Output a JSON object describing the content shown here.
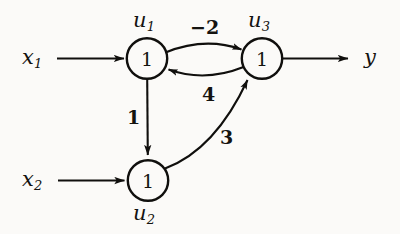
{
  "figure": {
    "kind": "signal-flow-graph",
    "background_color": "#fbfaf8",
    "ink_color": "#100f0d"
  },
  "inputs": [
    {
      "id": "x1",
      "label": "x",
      "subscript": "1",
      "arrow_name": "input-arrow-x1",
      "target": "u1"
    },
    {
      "id": "x2",
      "label": "x",
      "subscript": "2",
      "arrow_name": "input-arrow-x2",
      "target": "u2"
    }
  ],
  "output": {
    "id": "y",
    "label": "y",
    "arrow_name": "output-arrow-y",
    "source": "u3"
  },
  "nodes": [
    {
      "id": "u1",
      "name_label": "u",
      "name_subscript": "1",
      "value": "1",
      "label_position": "above"
    },
    {
      "id": "u2",
      "name_label": "u",
      "name_subscript": "2",
      "value": "1",
      "label_position": "below"
    },
    {
      "id": "u3",
      "name_label": "u",
      "name_subscript": "3",
      "value": "1",
      "label_position": "above"
    }
  ],
  "edges": [
    {
      "id": "u1-u3",
      "from": "u1",
      "to": "u3",
      "weight": "−2",
      "style": "curved-top"
    },
    {
      "id": "u3-u1",
      "from": "u3",
      "to": "u1",
      "weight": "4",
      "style": "curved-bottom"
    },
    {
      "id": "u1-u2",
      "from": "u1",
      "to": "u2",
      "weight": "1",
      "style": "straight-vertical"
    },
    {
      "id": "u2-u3",
      "from": "u2",
      "to": "u3",
      "weight": "3",
      "style": "curved-diagonal"
    }
  ]
}
